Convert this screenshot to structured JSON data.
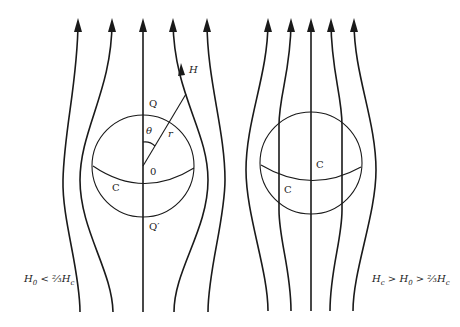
{
  "left_panel": {
    "labels": {
      "Q": "Q",
      "Q_prime": "Q′",
      "theta": "θ",
      "r": "r",
      "origin": "0",
      "C": "C",
      "H": "H"
    },
    "condition": {
      "H": "H",
      "sub0": "0",
      "rel": " < ",
      "frac": "⅔",
      "Hc": "H",
      "subc": "c"
    }
  },
  "right_panel": {
    "labels": {
      "C_upper": "C",
      "C_lower": "C"
    },
    "condition": {
      "Hc": "H",
      "subc": "c",
      "rel1": " > ",
      "H0": "H",
      "sub0": "0",
      "rel2": " > ",
      "frac": "⅔",
      "Hc2": "H",
      "subc2": "c"
    }
  },
  "colors": {
    "line": "#1a1a1a",
    "background": "#ffffff"
  }
}
